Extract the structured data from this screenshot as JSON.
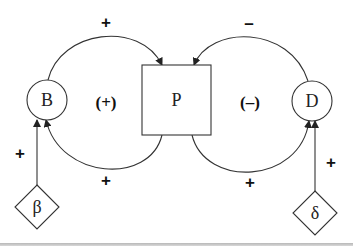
{
  "diagram": {
    "nodes": [
      {
        "id": "B",
        "label": "B",
        "shape": "circle"
      },
      {
        "id": "P",
        "label": "P",
        "shape": "square"
      },
      {
        "id": "D",
        "label": "D",
        "shape": "circle"
      },
      {
        "id": "beta",
        "label": "β",
        "shape": "diamond"
      },
      {
        "id": "delta",
        "label": "δ",
        "shape": "diamond"
      }
    ],
    "edges": [
      {
        "from": "B",
        "to": "P",
        "sign": "+",
        "position": "top-left-arc"
      },
      {
        "from": "P",
        "to": "B",
        "sign": "+",
        "position": "bottom-left-arc"
      },
      {
        "from": "D",
        "to": "P",
        "sign": "–",
        "position": "top-right-arc"
      },
      {
        "from": "P",
        "to": "D",
        "sign": "+",
        "position": "bottom-right-arc"
      },
      {
        "from": "beta",
        "to": "B",
        "sign": "+",
        "position": "left-vertical"
      },
      {
        "from": "delta",
        "to": "D",
        "sign": "+",
        "position": "right-vertical"
      }
    ],
    "loops": [
      {
        "label": "(+)",
        "nodes": [
          "B",
          "P"
        ]
      },
      {
        "label": "(–)",
        "nodes": [
          "P",
          "D"
        ]
      }
    ]
  },
  "labels": {
    "node_b": "B",
    "node_p": "P",
    "node_d": "D",
    "node_beta": "β",
    "node_delta": "δ",
    "sign_b_to_p": "+",
    "sign_p_to_b": "+",
    "sign_d_to_p": "–",
    "sign_p_to_d": "+",
    "sign_beta_to_b": "+",
    "sign_delta_to_d": "+",
    "loop_left": "(+)",
    "loop_right": "(–)"
  }
}
